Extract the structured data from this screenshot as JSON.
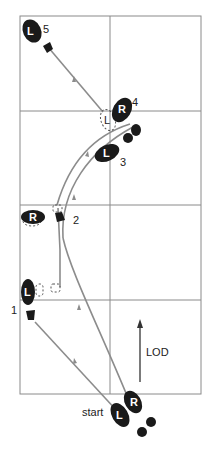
{
  "diagram": {
    "type": "dance-footwork",
    "direction_label": "LOD",
    "start_label": "start",
    "colors": {
      "grid": "#8a8a8a",
      "path": "#8c8c8c",
      "foot": "#1a1a1a",
      "ghost": "#555555"
    },
    "steps": [
      {
        "number": "1",
        "foot": "L"
      },
      {
        "number": "2",
        "foot": "R"
      },
      {
        "number": "3",
        "foot": "L"
      },
      {
        "number": "4",
        "foot": "R"
      },
      {
        "number": "5",
        "foot": "L"
      }
    ],
    "start_feet": [
      {
        "foot": "L"
      },
      {
        "foot": "R"
      }
    ],
    "ghost_foot_label": "L"
  }
}
